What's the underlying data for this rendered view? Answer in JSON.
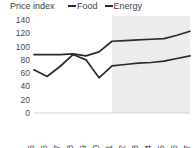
{
  "header": {
    "axis_title": "Price index"
  },
  "legend": {
    "position": "top",
    "items": [
      {
        "label": "Food",
        "color": "#2b2b2b",
        "icon": "line-swatch-icon"
      },
      {
        "label": "Energy",
        "color": "#2b2b2b",
        "icon": "line-swatch-icon"
      }
    ]
  },
  "chart_data": {
    "type": "line",
    "title": "",
    "subtitle": "",
    "xlabel": "",
    "ylabel": "Price index",
    "ylim": [
      0,
      140
    ],
    "ytick_labels": [
      "0",
      "20",
      "40",
      "60",
      "80",
      "100",
      "120",
      "140"
    ],
    "ytick_values": [
      0,
      20,
      40,
      60,
      80,
      100,
      120,
      140
    ],
    "grid": false,
    "legend_position": "top",
    "categories": [
      "2015",
      "2016",
      "2017",
      "2018",
      "2019",
      "2020",
      "2021",
      "2022",
      "2023",
      "2024",
      "2025",
      "2026",
      "2027"
    ],
    "x": [
      2015,
      2016,
      2017,
      2018,
      2019,
      2020,
      2021,
      2022,
      2023,
      2024,
      2025,
      2026,
      2027
    ],
    "series": [
      {
        "name": "Food",
        "color": "#2b2b2b",
        "values": [
          88,
          88,
          88,
          89,
          86,
          92,
          108,
          109,
          110,
          111,
          112,
          117,
          123
        ]
      },
      {
        "name": "Energy",
        "color": "#2b2b2b",
        "values": [
          65,
          55,
          70,
          88,
          80,
          53,
          71,
          73,
          75,
          76,
          78,
          82,
          86
        ]
      }
    ],
    "annotations": [
      {
        "type": "shaded-region",
        "name": "forecast-band",
        "from": 2021,
        "to": 2027,
        "color": "#ececec"
      }
    ]
  }
}
